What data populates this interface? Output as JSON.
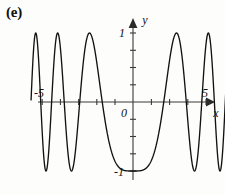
{
  "figure": {
    "panel_label": "(e)",
    "background_color": "#fdfdfb",
    "curve_color": "#121212",
    "axis_color": "#3a3a3a"
  },
  "axes": {
    "x_axis_label": "x",
    "y_axis_label": "y",
    "origin_label": "0",
    "x_min_label": "-5",
    "x_max_label": "5",
    "y_max_label": "1",
    "y_min_label": "-1"
  },
  "chart_data": {
    "type": "line",
    "title": "",
    "subtitle": "",
    "xlabel": "x",
    "ylabel": "y",
    "xlim": [
      -5.6,
      5.6
    ],
    "ylim": [
      -1.35,
      1.35
    ],
    "grid": false,
    "legend": null,
    "axis_style": "arrow-terminated cartesian axes through origin",
    "x_ticks": [
      -5,
      -4,
      -3,
      -2,
      -1,
      0,
      1,
      2,
      3,
      4,
      5
    ],
    "x_tick_labels": [
      "-5",
      "",
      "",
      "",
      "",
      "0",
      "",
      "",
      "",
      "",
      "5"
    ],
    "y_ticks": [
      -1,
      -0.5,
      0.5,
      1
    ],
    "y_tick_labels": [
      "-1",
      "",
      "",
      "1"
    ],
    "function_expression": "y = -cos(0.55 * x^2)",
    "amplitude": 1,
    "zero_at_origin": true,
    "series": [
      {
        "name": "y = -cos(0.55x^2)",
        "x": [
          -5.5,
          -5.4,
          -5.3,
          -5.2,
          -5.1,
          -5.0,
          -4.9,
          -4.8,
          -4.7,
          -4.6,
          -4.5,
          -4.4,
          -4.3,
          -4.2,
          -4.1,
          -4.0,
          -3.9,
          -3.8,
          -3.7,
          -3.6,
          -3.5,
          -3.4,
          -3.3,
          -3.2,
          -3.1,
          -3.0,
          -2.9,
          -2.8,
          -2.7,
          -2.6,
          -2.5,
          -2.4,
          -2.3,
          -2.2,
          -2.1,
          -2.0,
          -1.9,
          -1.8,
          -1.7,
          -1.6,
          -1.5,
          -1.4,
          -1.3,
          -1.2,
          -1.1,
          -1.0,
          -0.9,
          -0.8,
          -0.7,
          -0.6,
          -0.5,
          -0.4,
          -0.3,
          -0.2,
          -0.1,
          0.0,
          0.1,
          0.2,
          0.3,
          0.4,
          0.5,
          0.6,
          0.7,
          0.8,
          0.9,
          1.0,
          1.1,
          1.2,
          1.3,
          1.4,
          1.5,
          1.6,
          1.7,
          1.8,
          1.9,
          2.0,
          2.1,
          2.2,
          2.3,
          2.4,
          2.5,
          2.6,
          2.7,
          2.8,
          2.9,
          3.0,
          3.1,
          3.2,
          3.3,
          3.4,
          3.5,
          3.6,
          3.7,
          3.8,
          3.9,
          4.0,
          4.1,
          4.2,
          4.3,
          4.4,
          4.5,
          4.6,
          4.7,
          4.8,
          4.9,
          5.0,
          5.1,
          5.2,
          5.3,
          5.4,
          5.5
        ],
        "y": [
          -0.63,
          0.28,
          0.99,
          0.68,
          -0.25,
          -0.98,
          -0.73,
          0.17,
          0.95,
          0.81,
          -0.04,
          -0.88,
          -0.93,
          -0.25,
          0.72,
          1.0,
          0.51,
          -0.49,
          -1.0,
          -0.78,
          0.15,
          0.94,
          0.95,
          0.24,
          -0.71,
          -1.0,
          -0.57,
          0.39,
          0.99,
          0.89,
          0.06,
          -0.82,
          -1.0,
          -0.51,
          0.41,
          0.97,
          0.89,
          0.24,
          -0.53,
          -0.98,
          -0.89,
          -0.37,
          0.24,
          0.76,
          0.99,
          0.85,
          0.41,
          -0.13,
          -0.59,
          -0.88,
          -0.99,
          -0.96,
          -0.85,
          -0.71,
          -0.58,
          -0.5,
          -0.58,
          -0.71,
          -0.85,
          -0.96,
          -0.99,
          -0.88,
          -0.59,
          -0.13,
          0.41,
          0.85,
          0.99,
          0.76,
          0.24,
          -0.37,
          -0.89,
          -0.98,
          -0.53,
          0.24,
          0.89,
          0.97,
          0.41,
          -0.51,
          -1.0,
          -0.82,
          0.06,
          0.89,
          0.99,
          0.39,
          -0.57,
          -1.0,
          -0.71,
          0.24,
          0.95,
          0.94,
          0.15,
          -0.78,
          -1.0,
          -0.49,
          0.51,
          1.0,
          0.72,
          -0.25,
          -0.93,
          -0.88,
          -0.04,
          0.81,
          0.95,
          0.17,
          -0.73,
          -0.98,
          -0.25,
          0.68,
          0.99,
          0.28,
          -0.63
        ]
      }
    ]
  }
}
